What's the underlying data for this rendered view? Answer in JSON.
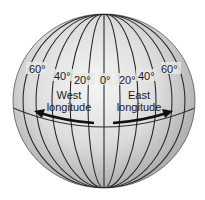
{
  "diagram": {
    "type": "globe-longitude",
    "colors": {
      "globe_light": "#f4f4f4",
      "globe_dark": "#9c9c9c",
      "lines": "#2a2a2a",
      "text": "#1a1a1a"
    },
    "meridian_labels": {
      "w60": "60°",
      "w40": "40°",
      "w20": "20°",
      "zero": "0°",
      "e20": "20°",
      "e40": "40°",
      "e60": "60°"
    },
    "west": {
      "line1": "West",
      "line2": "longitude"
    },
    "east": {
      "line1": "East",
      "line2": "longitude"
    }
  }
}
